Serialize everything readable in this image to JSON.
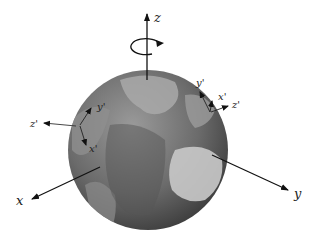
{
  "figure": {
    "globe": {
      "cx": 148,
      "cy": 150,
      "r": 80,
      "ocean_color": "#6a6a6a",
      "land_color": "#b8b8b8"
    },
    "global_axes": {
      "z": {
        "label": "z",
        "from": [
          147,
          80
        ],
        "to": [
          147,
          10
        ]
      },
      "x": {
        "label": "x",
        "from": [
          100,
          167
        ],
        "to": [
          30,
          200
        ]
      },
      "y": {
        "label": "y",
        "from": [
          212,
          155
        ],
        "to": [
          288,
          190
        ]
      }
    },
    "rotation_indicator": {
      "center": [
        147,
        47
      ],
      "rx": 15,
      "ry": 8
    },
    "local_frame_left": {
      "x_label": "x'",
      "y_label": "y'",
      "z_label": "z'"
    },
    "local_frame_right": {
      "x_label": "x'",
      "y_label": "y'",
      "z_label": "z'"
    }
  }
}
